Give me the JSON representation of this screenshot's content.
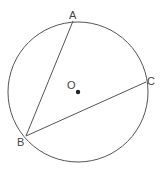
{
  "diagram": {
    "type": "circle-geometry",
    "circle": {
      "center_label": "O",
      "cx": 78,
      "cy": 92,
      "r": 70
    },
    "points": [
      {
        "label": "A",
        "x": 73,
        "y": 21
      },
      {
        "label": "B",
        "x": 26,
        "y": 136
      },
      {
        "label": "C",
        "x": 146,
        "y": 82
      }
    ],
    "chords": [
      {
        "from": "B",
        "to": "A"
      },
      {
        "from": "B",
        "to": "C"
      }
    ],
    "colors": {
      "stroke": "#555555",
      "dot": "#222222",
      "label": "#444444"
    }
  }
}
